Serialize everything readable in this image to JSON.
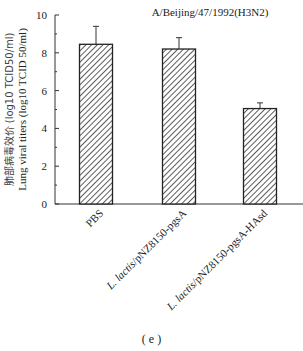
{
  "chart_data": {
    "type": "bar",
    "title": "A/Beijing/47/1992(H3N2)",
    "xlabel": "",
    "ylabel": "Lung viral titers (log10 TCID 50/ml)",
    "ylabel_cn": "肺部病毒效价 (log10 TCID50/ml)",
    "ylim": [
      0,
      10
    ],
    "yticks": [
      0,
      2,
      4,
      6,
      8,
      10
    ],
    "categories": [
      "PBS",
      "L. lactis/pNZ8150-pgsA",
      "L. lactis/pNZ8150-pgsA-HAsd"
    ],
    "values": [
      8.45,
      8.2,
      5.05
    ],
    "errors": [
      0.95,
      0.6,
      0.3
    ],
    "grid": false,
    "legend": null,
    "bar_fill": "hatched"
  },
  "caption": "( e )"
}
